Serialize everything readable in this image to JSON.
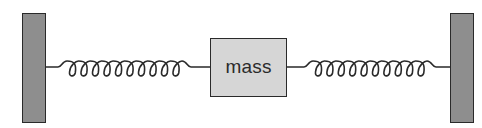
{
  "diagram": {
    "colors": {
      "background": "#ffffff",
      "wall_fill": "#8e8e8e",
      "mass_fill": "#d6d6d6",
      "stroke": "#2a2a2a"
    },
    "left_wall": {
      "x": 22,
      "y": 13,
      "width": 24,
      "height": 110
    },
    "right_wall": {
      "x": 450,
      "y": 13,
      "width": 24,
      "height": 110
    },
    "mass": {
      "label": "mass",
      "x": 210,
      "y": 38,
      "width": 77,
      "height": 59
    },
    "left_spring": {
      "from_x": 46,
      "to_x": 210,
      "y": 67,
      "coil_start_x": 67,
      "coil_end_x": 182,
      "loops": 10
    },
    "right_spring": {
      "from_x": 287,
      "to_x": 450,
      "y": 67,
      "coil_start_x": 313,
      "coil_end_x": 427,
      "loops": 10
    }
  }
}
